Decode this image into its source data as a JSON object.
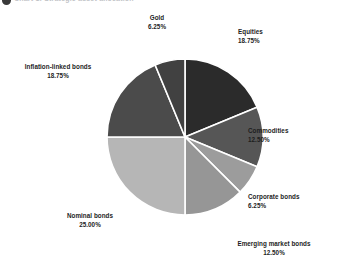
{
  "header": {
    "bullet_icon": "bullet-icon",
    "title": "Chart 1: Strategic asset allocation"
  },
  "chart_data": {
    "type": "pie",
    "title": "Strategic asset allocation",
    "xlabel": "",
    "ylabel": "",
    "legend_position": "none",
    "grid": false,
    "units": "%",
    "start_angle_deg": 0,
    "direction": "clockwise",
    "total": "100.00%",
    "categories": [
      "Equities",
      "Commodities",
      "Corporate bonds",
      "Emerging market bonds",
      "Nominal bonds",
      "Inflation-linked bonds",
      "Gold"
    ],
    "values": [
      18.75,
      12.5,
      6.25,
      12.5,
      25.0,
      18.75,
      6.25
    ],
    "slices": [
      {
        "name": "Equities",
        "value": 18.75,
        "label": "Equities",
        "percent": "18.75%",
        "color": "#2b2b2b",
        "start": 0,
        "end": 18.75
      },
      {
        "name": "Commodities",
        "value": 12.5,
        "label": "Commodities",
        "percent": "12.50%",
        "color": "#565656",
        "start": 18.75,
        "end": 31.25
      },
      {
        "name": "Corporate bonds",
        "value": 6.25,
        "label": "Corporate bonds",
        "percent": "6.25%",
        "color": "#9c9c9c",
        "start": 31.25,
        "end": 37.5
      },
      {
        "name": "Emerging market bonds",
        "value": 12.5,
        "label": "Emerging market bonds",
        "percent": "12.50%",
        "color": "#969696",
        "start": 37.5,
        "end": 50.0
      },
      {
        "name": "Nominal bonds",
        "value": 25.0,
        "label": "Nominal bonds",
        "percent": "25.00%",
        "color": "#b6b6b6",
        "start": 50.0,
        "end": 75.0
      },
      {
        "name": "Inflation-linked bonds",
        "value": 18.75,
        "label": "Inflation-linked bonds",
        "percent": "18.75%",
        "color": "#4b4b4b",
        "start": 75.0,
        "end": 93.75
      },
      {
        "name": "Gold",
        "value": 6.25,
        "label": "Gold",
        "percent": "6.25%",
        "color": "#414141",
        "start": 93.75,
        "end": 100.0
      }
    ],
    "geometry": {
      "cx": 185,
      "cy": 137,
      "r": 78,
      "separator_color": "#ffffff",
      "separator_width": 1.6,
      "background": "#ffffff"
    }
  }
}
